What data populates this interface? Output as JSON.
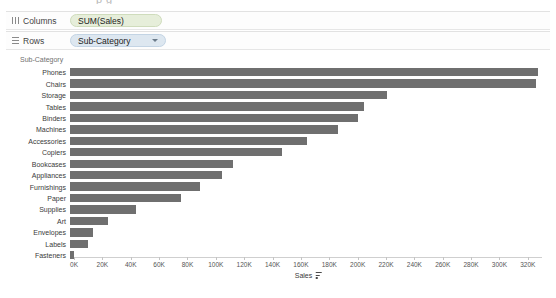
{
  "top_bleed_text": "p                              g",
  "shelves": [
    {
      "name": "columns",
      "label": "Columns",
      "icon": "columns-grid-icon",
      "pill": "SUM(Sales)",
      "pill_type": "measure",
      "has_caret": false
    },
    {
      "name": "rows",
      "label": "Rows",
      "icon": "rows-grid-icon",
      "pill": "Sub-Category",
      "pill_type": "dimension",
      "has_caret": true
    }
  ],
  "field_header": "Sub-Category",
  "axis": {
    "title": "Sales",
    "sort_icon": "sort-descending-icon",
    "ticks": [
      "0K",
      "20K",
      "40K",
      "60K",
      "80K",
      "100K",
      "120K",
      "140K",
      "160K",
      "180K",
      "200K",
      "220K",
      "240K",
      "260K",
      "280K",
      "300K",
      "320K"
    ]
  },
  "colors": {
    "bar": "#6f6f6f",
    "measure_pill": "#e6eeda",
    "dimension_pill": "#dde7f0"
  },
  "chart_data": {
    "type": "bar",
    "orientation": "horizontal",
    "title": "",
    "xlabel": "Sales",
    "ylabel": "Sub-Category",
    "xlim": [
      0,
      330000
    ],
    "grid": false,
    "legend": "none",
    "sorted": "descending",
    "tick_interval": 20000,
    "categories": [
      "Phones",
      "Chairs",
      "Storage",
      "Tables",
      "Binders",
      "Machines",
      "Accessories",
      "Copiers",
      "Bookcases",
      "Appliances",
      "Furnishings",
      "Paper",
      "Supplies",
      "Art",
      "Envelopes",
      "Labels",
      "Fasteners"
    ],
    "values": [
      330007,
      328449,
      223844,
      206966,
      203413,
      189239,
      167380,
      149528,
      114880,
      107532,
      91705,
      78479,
      46674,
      27119,
      16476,
      12486,
      3024
    ]
  }
}
